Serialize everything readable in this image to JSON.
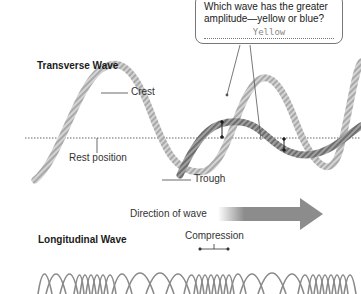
{
  "question_box": {
    "question": "Which wave has the greater amplitude—yellow or blue?",
    "answer": "Yellow"
  },
  "transverse": {
    "title": "Transverse Wave",
    "labels": {
      "crest": "Crest",
      "rest_position": "Rest position",
      "trough": "Trough"
    }
  },
  "direction": {
    "label": "Direction of wave"
  },
  "longitudinal": {
    "title": "Longitudinal Wave",
    "labels": {
      "compression": "Compression"
    }
  },
  "colors": {
    "rope_light": "#c8c8c8",
    "rope_dark": "#8a8a8a",
    "arrow": "#8c8c8c",
    "dotted_line": "#666666"
  }
}
